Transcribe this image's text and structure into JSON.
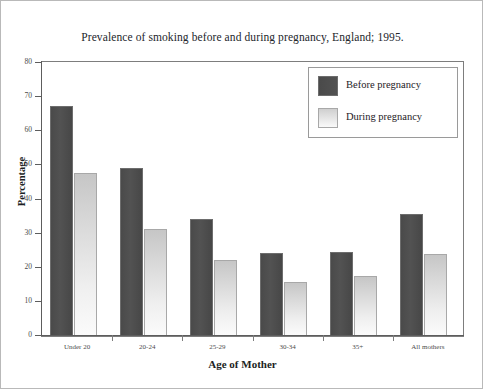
{
  "chart_data": {
    "type": "bar",
    "title": "Prevalence of smoking before and during pregnancy, England; 1995.",
    "xlabel": "Age of Mother",
    "ylabel": "Percentage",
    "categories": [
      "Under 20",
      "20-24",
      "25-29",
      "30-34",
      "35+",
      "All mothers"
    ],
    "series": [
      {
        "name": "Before pregnancy",
        "color": "#4d4d4d",
        "values": [
          67,
          49,
          34,
          24,
          24.3,
          35.5
        ]
      },
      {
        "name": "During pregnancy",
        "color": "#d9d9d9",
        "values": [
          47.5,
          31,
          22,
          15.5,
          17.3,
          23.8
        ]
      }
    ],
    "ylim": [
      0,
      80
    ],
    "yticks": [
      0,
      10,
      20,
      30,
      40,
      50,
      60,
      70,
      80
    ],
    "ytick_labels": [
      "0",
      "10",
      "20",
      "30",
      "40",
      "50",
      "60",
      "70",
      "80"
    ],
    "grid": false,
    "legend_position": "upper right"
  },
  "legend": {
    "entries": [
      {
        "label": "Before pregnancy",
        "swatch": "dark-gray-swatch"
      },
      {
        "label": "During pregnancy",
        "swatch": "light-gray-swatch"
      }
    ]
  }
}
